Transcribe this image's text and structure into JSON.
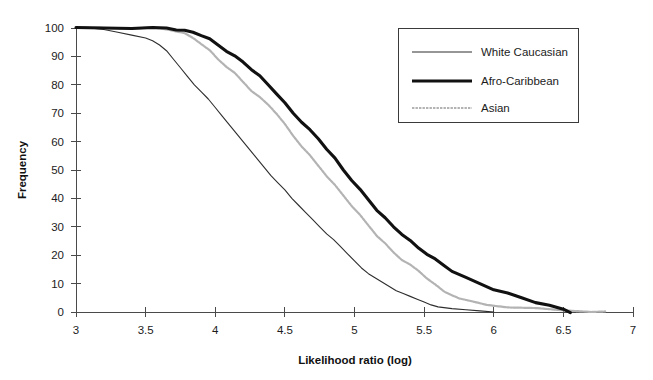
{
  "chart_data": {
    "type": "line",
    "title": "",
    "subtitle": "",
    "xlabel": "Likelihood ratio (log)",
    "ylabel": "Frequency",
    "xlim": [
      3,
      7
    ],
    "ylim": [
      0,
      100
    ],
    "grid": false,
    "legend_position": "top-right",
    "xticks": [
      "3",
      "3.5",
      "4",
      "4.5",
      "5",
      "5.5",
      "6",
      "6.5",
      "7"
    ],
    "xtick_values": [
      3,
      3.5,
      4,
      4.5,
      5,
      5.5,
      6,
      6.5,
      7
    ],
    "yticks": [
      "0",
      "10",
      "20",
      "30",
      "40",
      "50",
      "60",
      "70",
      "80",
      "90",
      "100"
    ],
    "ytick_values": [
      0,
      10,
      20,
      30,
      40,
      50,
      60,
      70,
      80,
      90,
      100
    ],
    "series": [
      {
        "name": "White Caucasian",
        "style": "thin-solid",
        "color": "#2e2e2e",
        "x": [
          3.0,
          3.1,
          3.2,
          3.3,
          3.4,
          3.5,
          3.55,
          3.6,
          3.65,
          3.7,
          3.75,
          3.8,
          3.85,
          3.9,
          3.95,
          4.0,
          4.05,
          4.1,
          4.15,
          4.2,
          4.25,
          4.3,
          4.35,
          4.4,
          4.45,
          4.5,
          4.55,
          4.6,
          4.65,
          4.7,
          4.75,
          4.8,
          4.85,
          4.9,
          4.95,
          5.0,
          5.05,
          5.1,
          5.15,
          5.2,
          5.25,
          5.3,
          5.35,
          5.4,
          5.45,
          5.5,
          5.55,
          5.6,
          5.7,
          5.8,
          5.9,
          6.0
        ],
        "y": [
          100,
          100,
          99.5,
          98.5,
          97.5,
          96.5,
          95.5,
          94,
          92,
          89,
          86,
          83,
          80,
          77.5,
          75,
          72,
          69,
          66,
          63,
          60,
          57,
          54,
          51,
          48,
          45.5,
          43,
          40,
          37.5,
          35,
          32.5,
          30,
          27.5,
          25.5,
          23,
          20.5,
          18,
          15.5,
          13.5,
          12,
          10.5,
          9,
          7.5,
          6.5,
          5.5,
          4.5,
          3.5,
          2.5,
          1.8,
          1.2,
          0.8,
          0.4,
          0
        ]
      },
      {
        "name": "Afro-Caribbean",
        "style": "thick-solid",
        "color": "#111111",
        "x": [
          3.0,
          3.2,
          3.4,
          3.55,
          3.65,
          3.72,
          3.78,
          3.84,
          3.9,
          3.96,
          4.02,
          4.08,
          4.14,
          4.2,
          4.26,
          4.32,
          4.38,
          4.44,
          4.5,
          4.56,
          4.62,
          4.68,
          4.74,
          4.8,
          4.86,
          4.92,
          4.98,
          5.04,
          5.1,
          5.16,
          5.22,
          5.28,
          5.34,
          5.4,
          5.46,
          5.52,
          5.58,
          5.64,
          5.7,
          5.8,
          5.9,
          6.0,
          6.1,
          6.2,
          6.3,
          6.4,
          6.5,
          6.55
        ],
        "y": [
          100,
          100,
          100,
          100,
          100,
          99.5,
          99,
          98.5,
          97.5,
          96,
          94,
          92,
          90,
          88,
          85.5,
          83,
          80,
          77,
          73.5,
          70,
          67,
          64,
          61,
          57.5,
          54,
          50,
          46.5,
          43,
          39.5,
          36,
          33,
          30,
          27.5,
          25,
          22.5,
          20.5,
          18.5,
          16.5,
          14.5,
          12,
          10,
          8,
          6.5,
          5,
          3.5,
          2.2,
          1.0,
          0
        ]
      },
      {
        "name": "Asian",
        "style": "dotted-light",
        "color": "#b3b3b3",
        "x": [
          3.0,
          3.2,
          3.4,
          3.55,
          3.65,
          3.72,
          3.78,
          3.84,
          3.9,
          3.96,
          4.02,
          4.08,
          4.14,
          4.2,
          4.26,
          4.32,
          4.38,
          4.44,
          4.5,
          4.56,
          4.62,
          4.68,
          4.74,
          4.8,
          4.86,
          4.92,
          4.98,
          5.04,
          5.1,
          5.16,
          5.22,
          5.28,
          5.34,
          5.4,
          5.46,
          5.52,
          5.58,
          5.65,
          5.75,
          5.85,
          5.95,
          6.1,
          6.3,
          6.5,
          6.7,
          6.8
        ],
        "y": [
          100,
          100,
          100,
          100,
          99.5,
          99,
          98,
          96.5,
          94.5,
          92,
          89,
          86.5,
          84,
          81,
          78,
          75.5,
          73,
          70,
          66,
          62,
          58.5,
          55,
          51.5,
          48,
          44.5,
          41,
          37.5,
          34,
          30.5,
          27,
          24,
          21,
          18.5,
          16.5,
          14.5,
          12,
          9.5,
          7,
          5,
          3.5,
          2.5,
          1.8,
          1.2,
          0.6,
          0.2,
          0
        ]
      }
    ]
  },
  "legend": {
    "entries": [
      {
        "label": "White Caucasian"
      },
      {
        "label": "Afro-Caribbean"
      },
      {
        "label": "Asian"
      }
    ]
  },
  "axes": {
    "x_title": "Likelihood ratio (log)",
    "y_title": "Frequency"
  }
}
